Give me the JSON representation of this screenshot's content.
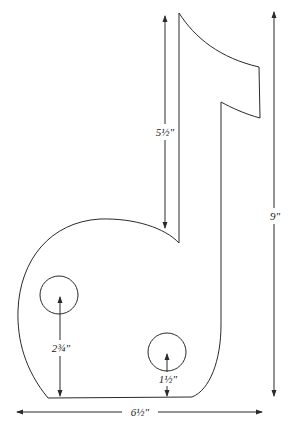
{
  "diagram": {
    "colors": {
      "line": "#2a2a2a",
      "background": "#ffffff",
      "text": "#222222"
    },
    "dimensions": {
      "stem_height": {
        "label": "5½\"",
        "value_in": 5.5
      },
      "total_height": {
        "label": "9\"",
        "value_in": 9
      },
      "total_width": {
        "label": "6½\"",
        "value_in": 6.5
      },
      "left_hole_height": {
        "label": "2¾\"",
        "value_in": 2.75
      },
      "right_hole_height": {
        "label": "1½\"",
        "value_in": 1.5
      }
    },
    "holes": [
      {
        "name": "left-hole",
        "cx": 59,
        "cy": 295,
        "r": 19
      },
      {
        "name": "right-hole",
        "cx": 167,
        "cy": 352,
        "r": 19
      }
    ]
  }
}
